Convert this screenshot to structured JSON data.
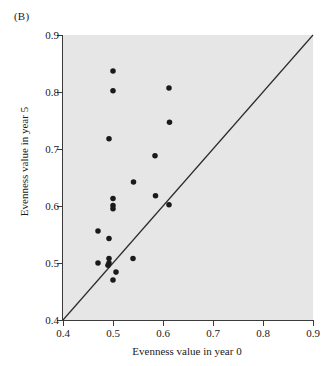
{
  "panel": {
    "label": "(B)"
  },
  "chart_data": {
    "type": "scatter",
    "title": "(B)",
    "xlabel": "Evenness value in year 0",
    "ylabel": "Evenness value in year 5",
    "xlim": [
      0.4,
      0.9
    ],
    "ylim": [
      0.4,
      0.9
    ],
    "xticks": [
      0.4,
      0.5,
      0.6,
      0.7,
      0.8,
      0.9
    ],
    "yticks": [
      0.4,
      0.5,
      0.6,
      0.7,
      0.8,
      0.9
    ],
    "xticklabels": [
      "0.4",
      "0.5",
      "0.6",
      "0.7",
      "0.8",
      "0.9"
    ],
    "yticklabels": [
      "0.4",
      "0.5",
      "0.6",
      "0.7",
      "0.8",
      "0.9"
    ],
    "grid": false,
    "legend": null,
    "plot_background": "#e6e6e6",
    "marker_color": "#1a1a1a",
    "marker_size": 4,
    "reference_line": {
      "name": "one-to-one line",
      "x": [
        0.4,
        0.9
      ],
      "y": [
        0.4,
        0.9
      ],
      "color": "#2b2b2b"
    },
    "points": [
      {
        "x": 0.5,
        "y": 0.837
      },
      {
        "x": 0.5,
        "y": 0.802
      },
      {
        "x": 0.612,
        "y": 0.807
      },
      {
        "x": 0.613,
        "y": 0.747
      },
      {
        "x": 0.492,
        "y": 0.718
      },
      {
        "x": 0.584,
        "y": 0.688
      },
      {
        "x": 0.541,
        "y": 0.642
      },
      {
        "x": 0.585,
        "y": 0.618
      },
      {
        "x": 0.612,
        "y": 0.602
      },
      {
        "x": 0.5,
        "y": 0.613
      },
      {
        "x": 0.5,
        "y": 0.601
      },
      {
        "x": 0.5,
        "y": 0.595
      },
      {
        "x": 0.47,
        "y": 0.556
      },
      {
        "x": 0.492,
        "y": 0.543
      },
      {
        "x": 0.47,
        "y": 0.5
      },
      {
        "x": 0.492,
        "y": 0.508
      },
      {
        "x": 0.492,
        "y": 0.5
      },
      {
        "x": 0.54,
        "y": 0.508
      },
      {
        "x": 0.49,
        "y": 0.496
      },
      {
        "x": 0.506,
        "y": 0.484
      },
      {
        "x": 0.5,
        "y": 0.47
      }
    ]
  },
  "axis": {
    "x": {
      "min": 0.4,
      "max": 0.9
    },
    "y": {
      "min": 0.4,
      "max": 0.9
    }
  }
}
